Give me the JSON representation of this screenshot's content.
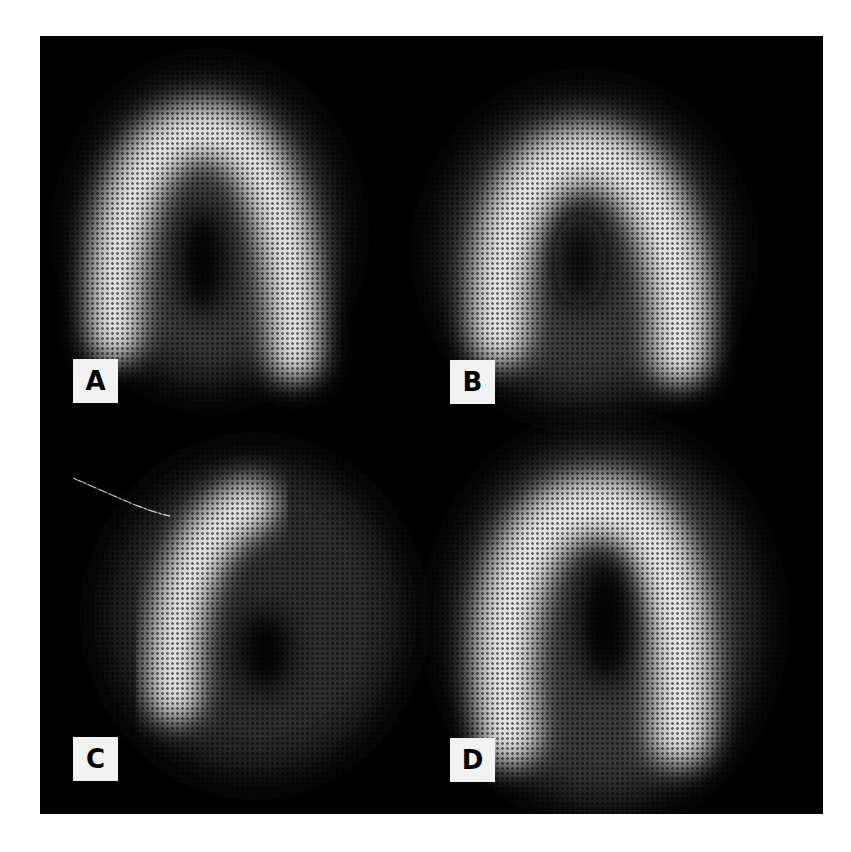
{
  "figure": {
    "background": "#000000",
    "panels": [
      {
        "id": "A",
        "label": "A"
      },
      {
        "id": "B",
        "label": "B"
      },
      {
        "id": "C",
        "label": "C"
      },
      {
        "id": "D",
        "label": "D"
      }
    ]
  }
}
